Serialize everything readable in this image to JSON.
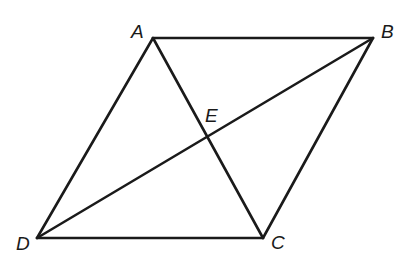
{
  "figure": {
    "type": "parallelogram-with-diagonals",
    "stroke_color": "#1a1a1a",
    "background": "#ffffff",
    "vertices": {
      "A": {
        "label": "A",
        "x": 153,
        "y": 38
      },
      "B": {
        "label": "B",
        "x": 373,
        "y": 38
      },
      "C": {
        "label": "C",
        "x": 263,
        "y": 238
      },
      "D": {
        "label": "D",
        "x": 37,
        "y": 238
      }
    },
    "intersection": {
      "label": "E",
      "x": 205,
      "y": 115
    },
    "segments": [
      "AB",
      "BC",
      "CD",
      "DA",
      "AC",
      "BD"
    ]
  }
}
